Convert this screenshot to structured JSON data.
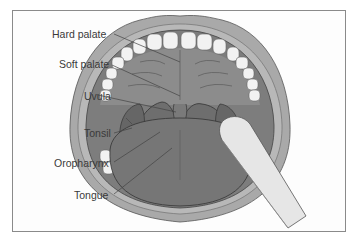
{
  "diagram": {
    "labels": [
      {
        "id": "hard-palate",
        "text": "Hard palate"
      },
      {
        "id": "soft-palate",
        "text": "Soft palate"
      },
      {
        "id": "uvula",
        "text": "Uvula"
      },
      {
        "id": "tonsil",
        "text": "Tonsil"
      },
      {
        "id": "oropharynx",
        "text": "Oropharynx"
      },
      {
        "id": "tongue",
        "text": "Tongue"
      }
    ],
    "colors": {
      "lips": "#a9a9a9",
      "mouth_interior": "#7d7d7d",
      "palate": "#8c8c8c",
      "tongue": "#767676",
      "tonsil": "#6e6e6e",
      "teeth": "#f2f2f2",
      "depressor": "#e6e6e6",
      "frame": "#8a8a8a",
      "label_text": "#3a3a3a"
    }
  }
}
